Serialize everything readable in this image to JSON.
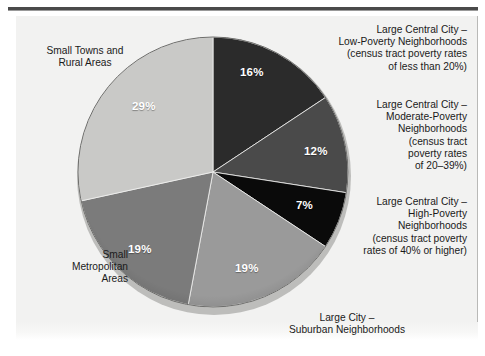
{
  "figure": {
    "background_color": "#ffffff",
    "panel_color": "#f2f2f1",
    "rule_color": "#4a4a4a"
  },
  "chart_data": {
    "type": "pie",
    "title": "",
    "subtitle": "",
    "xlabel": "",
    "ylabel": "",
    "legend_position": "callout-labels",
    "grid": false,
    "value_suffix": "%",
    "total": 102,
    "start_angle_deg": 0,
    "direction": "clockwise",
    "categories": [
      "Large Central City – Low-Poverty Neighborhoods (census tract poverty rates of less than 20%)",
      "Large Central City – Moderate-Poverty Neighborhoods (census tract poverty rates of 20–39%)",
      "Large Central City – High-Poverty Neighborhoods (census tract poverty rates of 40% or higher)",
      "Large City – Suburban Neighborhoods",
      "Small Metropolitan Areas",
      "Small Towns and Rural Areas"
    ],
    "values": [
      16,
      12,
      7,
      19,
      19,
      29
    ],
    "labels": [
      "16%",
      "12%",
      "7%",
      "19%",
      "19%",
      "29%"
    ],
    "colors": [
      "#2b2b2b",
      "#4a4a4a",
      "#0a0a0a",
      "#9a9a9a",
      "#7b7b7b",
      "#c9c9c7"
    ],
    "slices": [
      {
        "name": "large-central-city-low-poverty",
        "value": 16,
        "label": "16%",
        "color": "#2b2b2b",
        "callout": "Large Central City –\nLow-Poverty Neighborhoods\n(census tract poverty rates\nof less than 20%)"
      },
      {
        "name": "large-central-city-moderate-poverty",
        "value": 12,
        "label": "12%",
        "color": "#4a4a4a",
        "callout": "Large Central City –\nModerate-Poverty\nNeighborhoods\n(census tract\npoverty rates\nof 20–39%)"
      },
      {
        "name": "large-central-city-high-poverty",
        "value": 7,
        "label": "7%",
        "color": "#0a0a0a",
        "callout": "Large Central City –\nHigh-Poverty\nNeighborhoods\n(census tract poverty\nrates of 40% or higher)"
      },
      {
        "name": "large-city-suburban",
        "value": 19,
        "label": "19%",
        "color": "#9a9a9a",
        "callout": "Large City –\nSuburban Neighborhoods"
      },
      {
        "name": "small-metropolitan-areas",
        "value": 19,
        "label": "19%",
        "color": "#7b7b7b",
        "callout": "Small\nMetropolitan\nAreas"
      },
      {
        "name": "small-towns-and-rural-areas",
        "value": 29,
        "label": "29%",
        "color": "#c9c9c7",
        "callout": "Small Towns and\nRural Areas"
      }
    ]
  }
}
